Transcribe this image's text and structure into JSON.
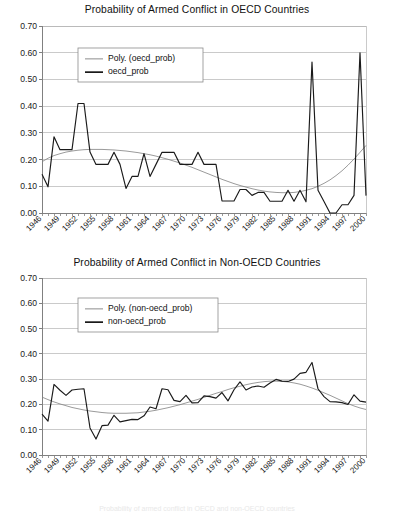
{
  "charts": [
    {
      "id": "oecd",
      "title": "Probability of Armed Conflict in OECD Countries",
      "legend": {
        "poly_label": "Poly. (oecd_prob)",
        "series_label": "oecd_prob"
      },
      "colors": {
        "series": "#1a1a1a",
        "trend": "#808080",
        "grid": "#b3b3b3",
        "axis": "#808080"
      },
      "chart_data": {
        "type": "line",
        "title": "Probability of Armed Conflict in OECD Countries",
        "xlabel": "",
        "ylabel": "",
        "ylim": [
          0.0,
          0.7
        ],
        "xlim": [
          1946,
          2000
        ],
        "grid": true,
        "legend_position": "upper-left-inside",
        "ytick_labels": [
          "0.00",
          "0.10",
          "0.20",
          "0.30",
          "0.40",
          "0.50",
          "0.60",
          "0.70"
        ],
        "ytick_values": [
          0.0,
          0.1,
          0.2,
          0.3,
          0.4,
          0.5,
          0.6,
          0.7
        ],
        "xtick_labels": [
          "1946",
          "1949",
          "1952",
          "1955",
          "1958",
          "1961",
          "1964",
          "1967",
          "1970",
          "1973",
          "1976",
          "1979",
          "1982",
          "1985",
          "1988",
          "1991",
          "1994",
          "1997",
          "2000"
        ],
        "x": [
          1946,
          1947,
          1948,
          1949,
          1950,
          1951,
          1952,
          1953,
          1954,
          1955,
          1956,
          1957,
          1958,
          1959,
          1960,
          1961,
          1962,
          1963,
          1964,
          1965,
          1966,
          1967,
          1968,
          1969,
          1970,
          1971,
          1972,
          1973,
          1974,
          1975,
          1976,
          1977,
          1978,
          1979,
          1980,
          1981,
          1982,
          1983,
          1984,
          1985,
          1986,
          1987,
          1988,
          1989,
          1990,
          1991,
          1992,
          1993,
          1994,
          1995,
          1996,
          1997,
          1998,
          1999,
          2000
        ],
        "series": [
          {
            "name": "oecd_prob",
            "kind": "data",
            "values": [
              0.145,
              0.098,
              0.285,
              0.237,
              0.237,
              0.237,
              0.41,
              0.41,
              0.228,
              0.182,
              0.182,
              0.182,
              0.227,
              0.182,
              0.092,
              0.137,
              0.137,
              0.222,
              0.137,
              0.182,
              0.227,
              0.227,
              0.227,
              0.182,
              0.182,
              0.182,
              0.227,
              0.182,
              0.182,
              0.182,
              0.045,
              0.045,
              0.045,
              0.088,
              0.088,
              0.066,
              0.077,
              0.077,
              0.044,
              0.044,
              0.044,
              0.085,
              0.044,
              0.085,
              0.042,
              0.565,
              0.085,
              0.043,
              0.0,
              0.0,
              0.031,
              0.031,
              0.066,
              0.6,
              0.065,
              0.366
            ]
          },
          {
            "name": "Poly. (oecd_prob)",
            "kind": "trend",
            "values": [
              0.192,
              0.205,
              0.215,
              0.222,
              0.228,
              0.232,
              0.235,
              0.237,
              0.238,
              0.238,
              0.238,
              0.237,
              0.236,
              0.234,
              0.232,
              0.229,
              0.226,
              0.222,
              0.218,
              0.213,
              0.207,
              0.201,
              0.194,
              0.187,
              0.179,
              0.171,
              0.162,
              0.153,
              0.144,
              0.135,
              0.126,
              0.118,
              0.11,
              0.103,
              0.097,
              0.091,
              0.086,
              0.082,
              0.079,
              0.077,
              0.076,
              0.076,
              0.077,
              0.08,
              0.085,
              0.091,
              0.1,
              0.111,
              0.124,
              0.14,
              0.158,
              0.179,
              0.202,
              0.227,
              0.253
            ]
          }
        ]
      }
    },
    {
      "id": "non-oecd",
      "title": "Probability of Armed Conflict in Non-OECD Countries",
      "legend": {
        "poly_label": "Poly. (non-oecd_prob)",
        "series_label": "non-oecd_prob"
      },
      "colors": {
        "series": "#1a1a1a",
        "trend": "#808080",
        "grid": "#b3b3b3",
        "axis": "#808080"
      },
      "chart_data": {
        "type": "line",
        "title": "Probability of Armed Conflict in Non-OECD Countries",
        "xlabel": "",
        "ylabel": "",
        "ylim": [
          0.0,
          0.7
        ],
        "xlim": [
          1946,
          2000
        ],
        "grid": true,
        "legend_position": "upper-left-inside",
        "ytick_labels": [
          "0.00",
          "0.10",
          "0.20",
          "0.30",
          "0.40",
          "0.50",
          "0.60",
          "0.70"
        ],
        "ytick_values": [
          0.0,
          0.1,
          0.2,
          0.3,
          0.4,
          0.5,
          0.6,
          0.7
        ],
        "xtick_labels": [
          "1946",
          "1949",
          "1952",
          "1955",
          "1958",
          "1961",
          "1964",
          "1967",
          "1970",
          "1973",
          "1976",
          "1979",
          "1982",
          "1985",
          "1988",
          "1991",
          "1994",
          "1997",
          "2000"
        ],
        "x": [
          1946,
          1947,
          1948,
          1949,
          1950,
          1951,
          1952,
          1953,
          1954,
          1955,
          1956,
          1957,
          1958,
          1959,
          1960,
          1961,
          1962,
          1963,
          1964,
          1965,
          1966,
          1967,
          1968,
          1969,
          1970,
          1971,
          1972,
          1973,
          1974,
          1975,
          1976,
          1977,
          1978,
          1979,
          1980,
          1981,
          1982,
          1983,
          1984,
          1985,
          1986,
          1987,
          1988,
          1989,
          1990,
          1991,
          1992,
          1993,
          1994,
          1995,
          1996,
          1997,
          1998,
          1999,
          2000
        ],
        "series": [
          {
            "name": "non-oecd_prob",
            "kind": "data",
            "values": [
              0.162,
              0.134,
              0.279,
              0.256,
              0.236,
              0.257,
              0.26,
              0.262,
              0.107,
              0.063,
              0.116,
              0.118,
              0.157,
              0.131,
              0.136,
              0.141,
              0.14,
              0.155,
              0.19,
              0.183,
              0.262,
              0.258,
              0.216,
              0.211,
              0.236,
              0.206,
              0.207,
              0.234,
              0.231,
              0.225,
              0.247,
              0.214,
              0.258,
              0.289,
              0.257,
              0.269,
              0.273,
              0.268,
              0.285,
              0.299,
              0.292,
              0.291,
              0.3,
              0.323,
              0.327,
              0.366,
              0.262,
              0.231,
              0.211,
              0.21,
              0.207,
              0.2,
              0.238,
              0.213,
              0.209
            ]
          },
          {
            "name": "Poly. (non-oecd_prob)",
            "kind": "trend",
            "values": [
              0.229,
              0.219,
              0.21,
              0.202,
              0.195,
              0.188,
              0.183,
              0.178,
              0.174,
              0.171,
              0.168,
              0.166,
              0.165,
              0.165,
              0.165,
              0.166,
              0.167,
              0.17,
              0.173,
              0.177,
              0.182,
              0.187,
              0.193,
              0.199,
              0.206,
              0.213,
              0.22,
              0.228,
              0.236,
              0.244,
              0.251,
              0.259,
              0.266,
              0.272,
              0.278,
              0.283,
              0.287,
              0.29,
              0.292,
              0.292,
              0.291,
              0.289,
              0.285,
              0.28,
              0.273,
              0.265,
              0.256,
              0.246,
              0.236,
              0.225,
              0.214,
              0.203,
              0.194,
              0.186,
              0.18
            ]
          }
        ]
      }
    }
  ],
  "footer_note": "Probability of armed conflict in OECD and non-OECD countries"
}
